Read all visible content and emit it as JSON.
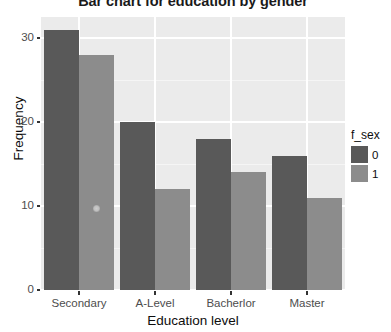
{
  "chart_data": {
    "type": "bar",
    "title": "Bar chart for education by gender",
    "xlabel": "Education level",
    "ylabel": "Frequency",
    "categories": [
      "Secondary",
      "A-Level",
      "Bacherlor",
      "Master"
    ],
    "series": [
      {
        "name": "0",
        "values": [
          31,
          20,
          18,
          16
        ],
        "color": "#595959"
      },
      {
        "name": "1",
        "values": [
          28,
          12,
          14,
          11
        ],
        "color": "#8c8c8c"
      }
    ],
    "ylim": [
      0,
      32.5
    ],
    "yticks": [
      0,
      10,
      20,
      30
    ],
    "ytick_labels": [
      "0",
      "10",
      "20",
      "30"
    ],
    "grid": true,
    "legend": {
      "title": "f_sex",
      "position": "right",
      "entries": [
        {
          "label": "0",
          "color": "#595959"
        },
        {
          "label": "1",
          "color": "#8c8c8c"
        }
      ]
    },
    "panel_background": "#ebebeb",
    "gridline_color": "#ffffff"
  }
}
